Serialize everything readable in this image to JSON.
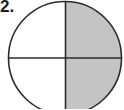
{
  "problem": {
    "number_label": "2."
  },
  "figure": {
    "shape": "circle",
    "parts": 4,
    "shaded_parts": 2,
    "shaded_quadrants": [
      "top-right",
      "bottom-right"
    ],
    "colors": {
      "shade": "#c4c4c4",
      "outline": "#2b2b2b",
      "background": "#ffffff"
    }
  }
}
